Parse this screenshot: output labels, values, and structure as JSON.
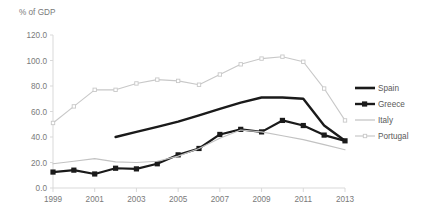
{
  "chart_data": {
    "type": "line",
    "title": "",
    "subtitle": "",
    "ylabel": "% of GDP",
    "xlabel": "",
    "grid": false,
    "legend_position": "right",
    "ylim": [
      0,
      120
    ],
    "ytick_labels": [
      "120.0",
      "100.0",
      "80.0",
      "60.0",
      "40.0",
      "20.0",
      "0.0"
    ],
    "ytick_values": [
      120,
      100,
      80,
      60,
      40,
      20,
      0
    ],
    "x": [
      1999,
      2000,
      2001,
      2002,
      2003,
      2004,
      2005,
      2006,
      2007,
      2008,
      2009,
      2010,
      2011,
      2012,
      2013
    ],
    "xtick_labels": [
      "1999",
      "2001",
      "2003",
      "2005",
      "2007",
      "2009",
      "2011",
      "2013"
    ],
    "xtick_values": [
      1999,
      2001,
      2003,
      2005,
      2007,
      2009,
      2011,
      2013
    ],
    "xlim": [
      1999,
      2013
    ],
    "series": [
      {
        "name": "Spain",
        "color": "#1a1a1a",
        "style": "thick-line",
        "markers": false,
        "x": [
          2002,
          2003,
          2004,
          2005,
          2006,
          2007,
          2008,
          2009,
          2010,
          2011,
          2012,
          2013
        ],
        "values": [
          40.0,
          44.0,
          48.0,
          52.0,
          57.0,
          62.0,
          67.0,
          71.0,
          71.0,
          70.0,
          49.0,
          37.0
        ]
      },
      {
        "name": "Greece",
        "color": "#1a1a1a",
        "style": "line-with-square-markers",
        "markers": true,
        "x": [
          1999,
          2000,
          2001,
          2002,
          2003,
          2004,
          2005,
          2006,
          2007,
          2008,
          2009,
          2010,
          2011,
          2012,
          2013
        ],
        "values": [
          12.5,
          14.0,
          11.0,
          15.5,
          15.0,
          19.0,
          26.0,
          31.0,
          42.0,
          46.0,
          44.0,
          53.0,
          49.0,
          41.5,
          37.0
        ]
      },
      {
        "name": "Italy",
        "color": "#c2c2c2",
        "style": "thin-line",
        "markers": false,
        "x": [
          1999,
          2000,
          2001,
          2002,
          2003,
          2004,
          2005,
          2006,
          2007,
          2008,
          2009,
          2010,
          2011,
          2012,
          2013
        ],
        "values": [
          19.0,
          21.0,
          23.0,
          20.5,
          20.0,
          21.0,
          25.0,
          31.0,
          39.0,
          45.5,
          44.0,
          41.0,
          38.0,
          34.0,
          30.0
        ]
      },
      {
        "name": "Portugal",
        "color": "#c8c8c8",
        "style": "line-with-markers",
        "markers": true,
        "x": [
          1999,
          2000,
          2001,
          2002,
          2003,
          2004,
          2005,
          2006,
          2007,
          2008,
          2009,
          2010,
          2011,
          2012,
          2013
        ],
        "values": [
          51.0,
          64.0,
          77.0,
          77.0,
          82.0,
          85.0,
          84.0,
          81.0,
          89.0,
          97.0,
          101.5,
          103.0,
          99.0,
          78.0,
          53.0
        ]
      }
    ]
  },
  "legend": {
    "items": [
      {
        "label": "Spain"
      },
      {
        "label": "Greece"
      },
      {
        "label": "Italy"
      },
      {
        "label": "Portugal"
      }
    ]
  }
}
